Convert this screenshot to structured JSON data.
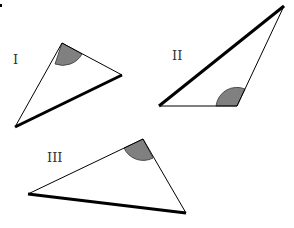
{
  "diagram": {
    "colors": {
      "stroke": "#000000",
      "angle_fill": "#808080",
      "label": "#333333"
    },
    "triangles": [
      {
        "label": "I",
        "label_pos": [
          13,
          64
        ],
        "vertices": [
          [
            62,
            43
          ],
          [
            122,
            75
          ],
          [
            15,
            127
          ]
        ],
        "shaded_angle_vertex": 0,
        "bold_side": [
          1,
          2
        ]
      },
      {
        "label": "II",
        "label_pos": [
          172,
          60
        ],
        "vertices": [
          [
            284,
            6
          ],
          [
            237,
            106
          ],
          [
            159,
            106
          ]
        ],
        "shaded_angle_vertex": 1,
        "bold_side": [
          0,
          2
        ]
      },
      {
        "label": "III",
        "label_pos": [
          47,
          162
        ],
        "vertices": [
          [
            143,
            139
          ],
          [
            186,
            213
          ],
          [
            28,
            194
          ]
        ],
        "shaded_angle_vertex": 0,
        "bold_side": [
          1,
          2
        ]
      }
    ]
  }
}
